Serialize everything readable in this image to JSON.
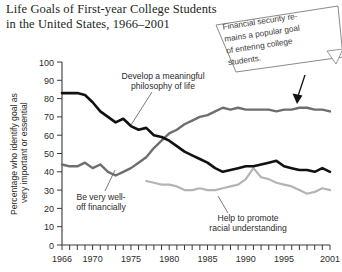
{
  "title": {
    "line1": "Life Goals of First-year College Students",
    "line2": "in the United States, 1966–2001"
  },
  "callout": {
    "line1": "Financial security re-",
    "line2": "mains a popular goal",
    "line3": "of entering college",
    "line4": "students."
  },
  "annotations": {
    "philosophy": {
      "line1": "Develop a meaningful",
      "line2": "philosophy of life"
    },
    "financial": {
      "line1": "Be very well-",
      "line2": "off financially"
    },
    "racial": {
      "line1": "Help to promote",
      "line2": "racial understanding"
    }
  },
  "colors": {
    "philosophy": "#111111",
    "financial": "#6e6e6e",
    "racial": "#b4b4b4",
    "axis": "#3a3a3a",
    "note_border": "#8a8a8a"
  },
  "chart_data": {
    "type": "line",
    "title": "Life Goals of First-year College Students in the United States, 1966–2001",
    "xlabel": "",
    "ylabel": "Percentage who identify goal as very important or essential",
    "xlim": [
      1966,
      2001
    ],
    "ylim": [
      0,
      100
    ],
    "grid": false,
    "legend": "inline-annotations",
    "ytick_labels": [
      "0",
      "10",
      "20",
      "30",
      "40",
      "50",
      "60",
      "70",
      "80",
      "90",
      "100"
    ],
    "yticks": [
      0,
      10,
      20,
      30,
      40,
      50,
      60,
      70,
      80,
      90,
      100
    ],
    "xtick_labels": [
      "1966",
      "1970",
      "1975",
      "1980",
      "1985",
      "1990",
      "1995",
      "2001"
    ],
    "xticks": [
      1966,
      1970,
      1975,
      1980,
      1985,
      1990,
      1995,
      2001
    ],
    "x": [
      1966,
      1967,
      1968,
      1969,
      1970,
      1971,
      1972,
      1973,
      1974,
      1975,
      1976,
      1977,
      1978,
      1979,
      1980,
      1981,
      1982,
      1983,
      1984,
      1985,
      1986,
      1987,
      1988,
      1989,
      1990,
      1991,
      1992,
      1993,
      1994,
      1995,
      1996,
      1997,
      1998,
      1999,
      2000,
      2001
    ],
    "series": [
      {
        "name": "Develop a meaningful philosophy of life",
        "color": "#111111",
        "values": [
          83,
          83,
          83,
          82,
          78,
          73,
          70,
          67,
          69,
          65,
          63,
          64,
          60,
          59,
          57,
          54,
          51,
          49,
          47,
          45,
          42,
          40,
          41,
          42,
          43,
          43,
          44,
          45,
          46,
          43,
          42,
          41,
          41,
          40,
          42,
          40
        ]
      },
      {
        "name": "Be very well-off financially",
        "color": "#6e6e6e",
        "values": [
          44,
          43,
          43,
          45,
          42,
          44,
          40,
          38,
          40,
          42,
          45,
          48,
          53,
          57,
          61,
          63,
          66,
          68,
          70,
          71,
          73,
          75,
          74,
          75,
          74,
          74,
          74,
          74,
          73,
          74,
          74,
          75,
          75,
          74,
          74,
          73
        ]
      },
      {
        "name": "Help to promote racial understanding",
        "color": "#b4b4b4",
        "values": [
          null,
          null,
          null,
          null,
          null,
          null,
          null,
          null,
          null,
          null,
          null,
          35,
          34,
          33,
          33,
          32,
          30,
          30,
          31,
          30,
          30,
          31,
          32,
          33,
          36,
          42,
          37,
          36,
          34,
          33,
          32,
          30,
          28,
          29,
          31,
          30
        ]
      }
    ]
  }
}
